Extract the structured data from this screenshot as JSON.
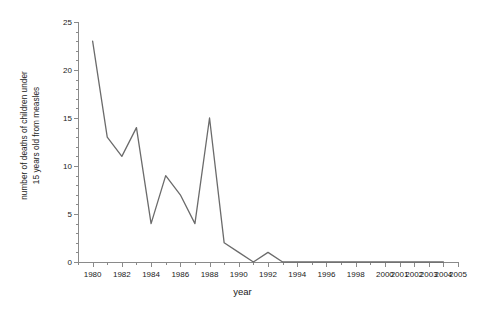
{
  "chart_data": {
    "type": "line",
    "title": "",
    "xlabel": "year",
    "ylabel": "number of deaths of children under 15 years old from measles",
    "ylabel_line1": "number of deaths of children under",
    "ylabel_line2": "15 years old from measles",
    "ylim": [
      0,
      25
    ],
    "y_major_ticks": [
      0,
      5,
      10,
      15,
      20,
      25
    ],
    "y_tick_labels": [
      "0",
      "5",
      "10",
      "15",
      "20",
      "25"
    ],
    "y_minor_step": 1,
    "grid": false,
    "legend": "none",
    "line_color": "#6b6b6b",
    "axis_color": "#8a8a8a",
    "x_axis_kind": "categorical",
    "x_axis_note": "even years labeled 1980-1998, then every year 2000-2005",
    "x_tick_labels": [
      "1980",
      "1982",
      "1984",
      "1986",
      "1988",
      "1990",
      "1992",
      "1994",
      "1996",
      "1998",
      "2000",
      "2001",
      "2002",
      "2003",
      "2004",
      "2005"
    ],
    "categories": [
      "1980",
      "1981",
      "1982",
      "1983",
      "1984",
      "1985",
      "1986",
      "1987",
      "1988",
      "1989",
      "1990",
      "1991",
      "1992",
      "1993",
      "1994",
      "1995",
      "1996",
      "1997",
      "1998",
      "1999",
      "2000",
      "2001",
      "2002",
      "2003",
      "2004"
    ],
    "values": [
      23,
      13,
      11,
      14,
      4,
      9,
      7,
      4,
      15,
      2,
      1,
      0,
      1,
      0,
      0,
      0,
      0,
      0,
      0,
      0,
      0,
      0,
      0,
      0,
      0
    ],
    "series": [
      {
        "name": "deaths from measles",
        "values": [
          23,
          13,
          11,
          14,
          4,
          9,
          7,
          4,
          15,
          2,
          1,
          0,
          1,
          0,
          0,
          0,
          0,
          0,
          0,
          0,
          0,
          0,
          0,
          0,
          0
        ]
      }
    ]
  }
}
